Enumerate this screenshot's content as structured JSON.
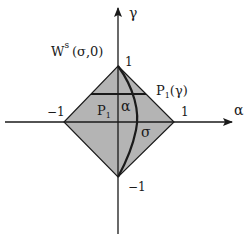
{
  "diagram": {
    "type": "diamond-region-in-alpha-gamma-plane",
    "colors": {
      "fill": "#b4b4b4",
      "stroke": "#1a1a1a",
      "background": "#ffffff"
    },
    "axes": {
      "horizontal": {
        "label": "α"
      },
      "vertical": {
        "label": "γ"
      }
    },
    "ticks": {
      "alpha_neg": "−1",
      "alpha_pos": "1",
      "gamma_pos": "1",
      "gamma_neg": "−1"
    },
    "labels": {
      "manifold_main": "W",
      "manifold_sup": "s",
      "manifold_args": "(σ,0)",
      "slice_main": "P",
      "slice_sub": "1",
      "slice_arg": "(γ)",
      "region_main": "P",
      "region_sub": "1",
      "alpha_region": "α",
      "sigma_region": "σ"
    }
  }
}
